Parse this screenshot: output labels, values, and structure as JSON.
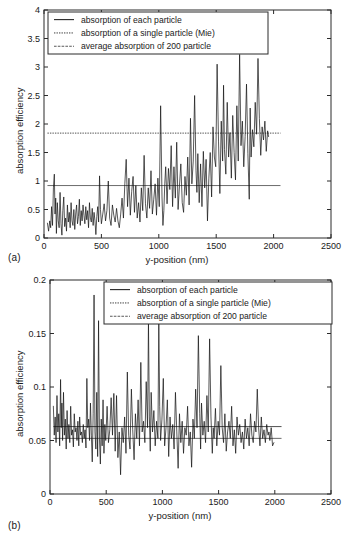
{
  "figure": {
    "panels": [
      {
        "tag": "(a)",
        "xlabel": "y-position (nm)",
        "ylabel": "absorption efficiency"
      },
      {
        "tag": "(b)",
        "xlabel": "y-position (nm)",
        "ylabel": "absorption efficiency"
      }
    ],
    "legend_entries": [
      "absorption of each particle",
      "absorption of a single particle (Mie)",
      "average absorption of 200 particle"
    ]
  },
  "chart_data": [
    {
      "type": "line",
      "panel": "(a)",
      "title": "",
      "xlabel": "y-position (nm)",
      "ylabel": "absorption efficiency",
      "xlim": [
        0,
        2500
      ],
      "ylim": [
        0,
        4
      ],
      "xticks": [
        0,
        500,
        1000,
        1500,
        2000,
        2500
      ],
      "xtick_labels": [
        "0",
        "500",
        "1000",
        "1500",
        "2000",
        "2500"
      ],
      "yticks": [
        0,
        0.5,
        1,
        1.5,
        2,
        2.5,
        3,
        3.5,
        4
      ],
      "ytick_labels": [
        "0",
        "0.5",
        "1",
        "1.5",
        "2",
        "2.5",
        "3",
        "3.5",
        "4"
      ],
      "grid": false,
      "legend_position": "upper-left-inside",
      "legend": [
        "absorption of each particle",
        "absorption of a single particle (Mie)",
        "average absorption of 200 particle"
      ],
      "reference_lines": [
        {
          "name": "absorption of a single particle (Mie)",
          "style": "dotted",
          "y": 1.84,
          "x_start": 30,
          "x_end": 2060
        },
        {
          "name": "average absorption of 200 particle",
          "style": "solid",
          "y": 0.92,
          "x_start": 30,
          "x_end": 2060
        }
      ],
      "series": [
        {
          "name": "absorption of each particle",
          "x": [
            30,
            40,
            50,
            58,
            66,
            74,
            82,
            90,
            96,
            102,
            108,
            116,
            124,
            132,
            140,
            148,
            156,
            164,
            172,
            180,
            188,
            196,
            204,
            212,
            220,
            228,
            236,
            244,
            252,
            260,
            268,
            276,
            284,
            292,
            300,
            308,
            316,
            324,
            332,
            340,
            348,
            356,
            364,
            372,
            380,
            388,
            396,
            404,
            412,
            420,
            428,
            436,
            444,
            452,
            460,
            468,
            476,
            484,
            492,
            500,
            512,
            524,
            536,
            548,
            560,
            572,
            584,
            596,
            608,
            620,
            632,
            644,
            656,
            668,
            680,
            692,
            704,
            716,
            728,
            740,
            752,
            764,
            776,
            788,
            800,
            812,
            824,
            836,
            848,
            860,
            872,
            884,
            896,
            908,
            920,
            932,
            944,
            956,
            968,
            980,
            992,
            1004,
            1016,
            1028,
            1036,
            1044,
            1052,
            1060,
            1072,
            1084,
            1096,
            1108,
            1120,
            1132,
            1144,
            1156,
            1168,
            1180,
            1192,
            1204,
            1216,
            1228,
            1240,
            1252,
            1264,
            1276,
            1288,
            1300,
            1312,
            1324,
            1332,
            1340,
            1352,
            1364,
            1376,
            1388,
            1400,
            1412,
            1424,
            1436,
            1448,
            1460,
            1472,
            1484,
            1496,
            1508,
            1520,
            1532,
            1544,
            1556,
            1564,
            1572,
            1584,
            1596,
            1608,
            1620,
            1632,
            1644,
            1656,
            1668,
            1680,
            1692,
            1704,
            1716,
            1728,
            1740,
            1752,
            1764,
            1776,
            1788,
            1796,
            1804,
            1816,
            1828,
            1840,
            1852,
            1864,
            1876,
            1888,
            1900,
            1912,
            1924,
            1936,
            1948,
            1956,
            1964,
            1976,
            1988,
            2000,
            2012,
            2024,
            2036,
            2048
          ],
          "y": [
            0.26,
            0.12,
            0.3,
            0.18,
            0.55,
            0.22,
            0.88,
            1.12,
            0.42,
            0.7,
            0.08,
            0.62,
            0.3,
            0.18,
            0.8,
            0.25,
            0.05,
            0.48,
            0.72,
            0.2,
            0.35,
            0.12,
            0.58,
            0.28,
            0.45,
            0.18,
            0.62,
            0.3,
            0.22,
            0.5,
            0.15,
            0.42,
            0.58,
            0.25,
            0.38,
            0.68,
            0.22,
            0.48,
            0.3,
            0.58,
            0.4,
            0.25,
            0.55,
            0.32,
            0.48,
            0.18,
            0.62,
            0.35,
            0.28,
            0.52,
            0.22,
            0.45,
            0.3,
            0.06,
            0.38,
            0.55,
            0.28,
            1.09,
            0.5,
            0.25,
            0.42,
            0.6,
            0.3,
            0.48,
            1.0,
            0.35,
            0.22,
            0.58,
            0.4,
            0.28,
            0.52,
            0.3,
            0.18,
            0.42,
            0.7,
            0.35,
            0.95,
            1.38,
            0.55,
            1.05,
            0.4,
            0.82,
            1.08,
            0.45,
            0.92,
            0.35,
            0.62,
            0.28,
            0.88,
            0.48,
            1.45,
            0.6,
            0.35,
            0.88,
            0.52,
            1.18,
            0.42,
            0.68,
            0.95,
            0.4,
            1.05,
            0.55,
            2.32,
            0.72,
            0.22,
            0.48,
            0.95,
            1.25,
            0.6,
            1.22,
            0.85,
            1.62,
            0.55,
            1.25,
            0.7,
            1.68,
            0.5,
            0.92,
            1.3,
            0.62,
            0.45,
            1.08,
            0.75,
            1.42,
            0.58,
            2.1,
            0.95,
            1.35,
            2.5,
            1.18,
            0.8,
            1.48,
            0.62,
            1.3,
            0.55,
            1.52,
            0.88,
            1.38,
            0.3,
            1.05,
            1.5,
            0.72,
            1.95,
            1.42,
            1.25,
            3.05,
            1.7,
            0.78,
            2.05,
            1.35,
            2.68,
            1.55,
            1.12,
            2.38,
            1.42,
            1.85,
            1.05,
            2.15,
            1.5,
            1.02,
            2.32,
            1.35,
            3.22,
            1.62,
            2.05,
            1.25,
            1.78,
            2.7,
            1.48,
            0.68,
            2.28,
            1.42,
            1.9,
            1.6,
            2.38,
            1.82,
            3.15,
            2.1,
            1.45,
            1.95,
            1.72,
            2.05,
            1.52,
            1.88,
            1.78
          ]
        }
      ]
    },
    {
      "type": "line",
      "panel": "(b)",
      "title": "",
      "xlabel": "y-position (nm)",
      "ylabel": "absorption efficiency",
      "xlim": [
        0,
        2500
      ],
      "ylim": [
        0,
        0.2
      ],
      "xticks": [
        0,
        500,
        1000,
        1500,
        2000,
        2500
      ],
      "xtick_labels": [
        "0",
        "500",
        "1000",
        "1500",
        "2000",
        "2500"
      ],
      "yticks": [
        0,
        0.05,
        0.1,
        0.15,
        0.2
      ],
      "ytick_labels": [
        "0",
        "0.05",
        "0.1",
        "0.15",
        "0.2"
      ],
      "grid": false,
      "legend_position": "upper-center-inside",
      "legend": [
        "absorption of each particle",
        "absorption of a single particle (Mie)",
        "average absorption of 200 particle"
      ],
      "reference_lines": [
        {
          "name": "absorption of a single particle (Mie)",
          "style": "solid",
          "y": 0.063,
          "x_start": 30,
          "x_end": 2060
        },
        {
          "name": "average absorption of 200 particle",
          "style": "solid",
          "y": 0.052,
          "x_start": 30,
          "x_end": 2060
        }
      ],
      "series": [
        {
          "name": "absorption of each particle",
          "x": [
            30,
            38,
            46,
            54,
            62,
            70,
            78,
            86,
            94,
            100,
            106,
            112,
            120,
            128,
            136,
            144,
            152,
            160,
            168,
            176,
            184,
            192,
            200,
            208,
            216,
            224,
            232,
            240,
            248,
            256,
            264,
            272,
            280,
            288,
            296,
            304,
            312,
            320,
            328,
            336,
            344,
            352,
            360,
            368,
            376,
            384,
            392,
            400,
            408,
            416,
            424,
            432,
            440,
            448,
            456,
            464,
            472,
            480,
            488,
            496,
            508,
            520,
            532,
            544,
            556,
            568,
            580,
            592,
            604,
            616,
            628,
            640,
            652,
            664,
            676,
            688,
            700,
            712,
            724,
            736,
            748,
            760,
            772,
            784,
            796,
            808,
            820,
            832,
            844,
            856,
            868,
            876,
            884,
            892,
            900,
            912,
            924,
            936,
            948,
            960,
            968,
            976,
            984,
            996,
            1008,
            1020,
            1032,
            1044,
            1056,
            1068,
            1080,
            1092,
            1104,
            1116,
            1128,
            1140,
            1152,
            1164,
            1176,
            1188,
            1200,
            1212,
            1224,
            1236,
            1248,
            1260,
            1272,
            1284,
            1296,
            1308,
            1320,
            1332,
            1340,
            1348,
            1360,
            1372,
            1384,
            1396,
            1408,
            1420,
            1432,
            1444,
            1452,
            1460,
            1472,
            1484,
            1496,
            1508,
            1520,
            1532,
            1544,
            1556,
            1568,
            1580,
            1592,
            1604,
            1616,
            1628,
            1640,
            1652,
            1664,
            1676,
            1688,
            1700,
            1712,
            1724,
            1736,
            1748,
            1760,
            1772,
            1784,
            1796,
            1808,
            1820,
            1832,
            1844,
            1856,
            1868,
            1880,
            1892,
            1904,
            1916,
            1928,
            1940,
            1948,
            1956,
            1968,
            1980,
            1992,
            2004,
            2016,
            2028,
            2040,
            2050
          ],
          "y": [
            0.082,
            0.055,
            0.072,
            0.048,
            0.092,
            0.058,
            0.075,
            0.045,
            0.107,
            0.062,
            0.085,
            0.05,
            0.095,
            0.055,
            0.07,
            0.042,
            0.078,
            0.052,
            0.065,
            0.048,
            0.082,
            0.055,
            0.06,
            0.044,
            0.075,
            0.058,
            0.062,
            0.05,
            0.068,
            0.045,
            0.072,
            0.055,
            0.058,
            0.048,
            0.065,
            0.052,
            0.06,
            0.043,
            0.108,
            0.062,
            0.07,
            0.05,
            0.085,
            0.055,
            0.03,
            0.075,
            0.186,
            0.058,
            0.042,
            0.095,
            0.035,
            0.162,
            0.052,
            0.028,
            0.07,
            0.045,
            0.088,
            0.038,
            0.065,
            0.05,
            0.082,
            0.048,
            0.06,
            0.09,
            0.055,
            0.094,
            0.04,
            0.092,
            0.034,
            0.058,
            0.018,
            0.062,
            0.048,
            0.072,
            0.038,
            0.114,
            0.055,
            0.042,
            0.098,
            0.06,
            0.032,
            0.075,
            0.052,
            0.088,
            0.045,
            0.123,
            0.058,
            0.068,
            0.048,
            0.105,
            0.062,
            0.162,
            0.072,
            0.04,
            0.095,
            0.058,
            0.078,
            0.045,
            0.068,
            0.052,
            0.16,
            0.082,
            0.05,
            0.07,
            0.108,
            0.045,
            0.062,
            0.088,
            0.035,
            0.072,
            0.052,
            0.065,
            0.042,
            0.095,
            0.058,
            0.024,
            0.075,
            0.048,
            0.068,
            0.038,
            0.062,
            0.055,
            0.082,
            0.045,
            0.058,
            0.025,
            0.07,
            0.052,
            0.098,
            0.062,
            0.148,
            0.075,
            0.042,
            0.085,
            0.055,
            0.068,
            0.048,
            0.092,
            0.058,
            0.145,
            0.072,
            0.038,
            0.062,
            0.052,
            0.08,
            0.045,
            0.068,
            0.055,
            0.12,
            0.062,
            0.048,
            0.075,
            0.04,
            0.058,
            0.068,
            0.052,
            0.082,
            0.045,
            0.06,
            0.038,
            0.072,
            0.055,
            0.065,
            0.048,
            0.058,
            0.042,
            0.07,
            0.052,
            0.062,
            0.045,
            0.075,
            0.055,
            0.048,
            0.068,
            0.058,
            0.098,
            0.062,
            0.045,
            0.072,
            0.052,
            0.06,
            0.048,
            0.065,
            0.055,
            0.058,
            0.05,
            0.062,
            0.045,
            0.048
          ]
        }
      ]
    }
  ]
}
